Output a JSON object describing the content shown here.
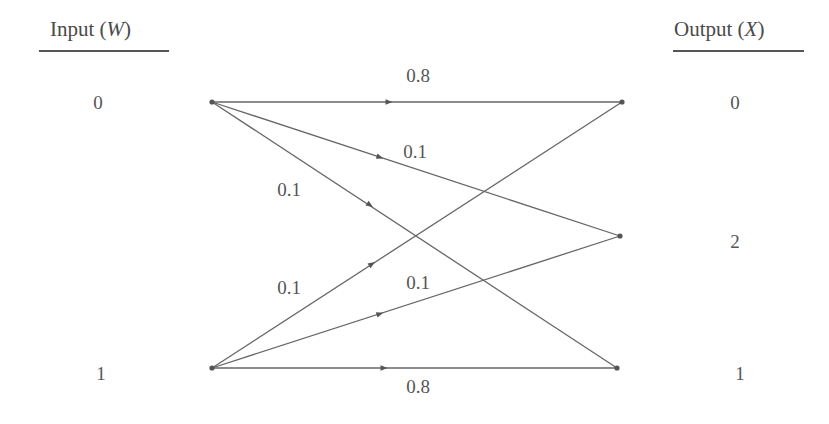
{
  "headers": {
    "input": {
      "text": "Input (",
      "var": "W",
      "close": ")"
    },
    "output": {
      "text": "Output (",
      "var": "X",
      "close": ")"
    }
  },
  "input_nodes": [
    {
      "label": "0",
      "x": 212,
      "y": 102
    },
    {
      "label": "1",
      "x": 212,
      "y": 368
    }
  ],
  "output_nodes": [
    {
      "label": "0",
      "x": 622,
      "y": 102
    },
    {
      "label": "2",
      "x": 620,
      "y": 236
    },
    {
      "label": "1",
      "x": 617,
      "y": 368
    }
  ],
  "edges": [
    {
      "from": "0",
      "to": "0",
      "prob": "0.8"
    },
    {
      "from": "0",
      "to": "2",
      "prob": "0.1"
    },
    {
      "from": "0",
      "to": "1",
      "prob": "0.1"
    },
    {
      "from": "1",
      "to": "0",
      "prob": "0.1"
    },
    {
      "from": "1",
      "to": "2",
      "prob": "0.1"
    },
    {
      "from": "1",
      "to": "1",
      "prob": "0.8"
    }
  ],
  "colors": {
    "line": "#666666",
    "text": "#555555",
    "background": "#ffffff"
  }
}
